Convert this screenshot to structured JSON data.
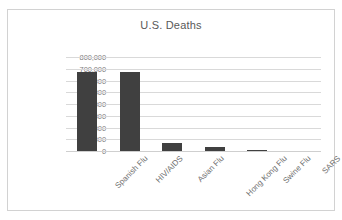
{
  "chart_data": {
    "type": "bar",
    "title": "U.S. Deaths",
    "xlabel": "",
    "ylabel": "",
    "categories": [
      "Spanish Flu",
      "HIV/AIDS",
      "Asian Flu",
      "Hong Kong Flu",
      "Swine Flu",
      "SARS"
    ],
    "values": [
      675000,
      675000,
      70000,
      34000,
      12500,
      0
    ],
    "ylim": [
      0,
      800000
    ],
    "ytick_values": [
      800000,
      700000,
      600000,
      500000,
      400000,
      300000,
      200000,
      100000,
      0
    ],
    "ytick_labels": [
      "800,000",
      "700,000",
      "600,000",
      "500,000",
      "400,000",
      "300,000",
      "200,000",
      "100,000",
      "0"
    ],
    "grid": "horizontal",
    "legend": "none",
    "series": [
      {
        "name": "U.S. Deaths",
        "color": "#404040",
        "values": [
          675000,
          675000,
          70000,
          34000,
          12500,
          0
        ]
      }
    ]
  },
  "frame": {
    "border_color": "#d2d2d2",
    "background": "#ffffff"
  }
}
